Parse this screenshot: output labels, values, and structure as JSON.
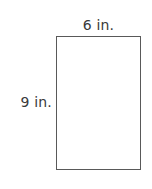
{
  "figure": {
    "type": "geometry-diagram",
    "shape": "rectangle",
    "background_color": "#ffffff",
    "stroke_color": "#595959",
    "text_color": "#3a3a3a",
    "labels": {
      "top": "6 in.",
      "left": "9 in."
    },
    "dimensions": {
      "width_value": 6,
      "height_value": 9,
      "unit": "in."
    }
  }
}
